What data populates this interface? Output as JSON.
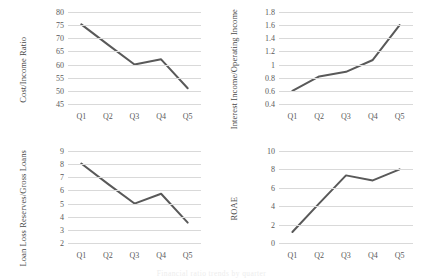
{
  "figure": {
    "caption": "Financial ratio trends by quarter"
  },
  "chart_data": [
    {
      "type": "line",
      "title": "",
      "ylabel": "Cost/Income Ratio",
      "xlabel": "",
      "categories": [
        "Q1",
        "Q2",
        "Q3",
        "Q4",
        "Q5"
      ],
      "values": [
        75.3,
        67.6,
        60.0,
        62.0,
        51.0
      ],
      "yticks": [
        45,
        50,
        55,
        60,
        65,
        70,
        75,
        80
      ],
      "yticklabels": [
        "45",
        "50",
        "55",
        "60",
        "65",
        "70",
        "75",
        "80"
      ],
      "ylim": [
        45,
        80
      ],
      "grid": true,
      "legend": "none",
      "line_color": "#595959"
    },
    {
      "type": "line",
      "title": "",
      "ylabel": "Interest Income/Operating Income",
      "xlabel": "",
      "categories": [
        "Q1",
        "Q2",
        "Q3",
        "Q4",
        "Q5"
      ],
      "values": [
        0.6,
        0.82,
        0.89,
        1.07,
        1.6
      ],
      "yticks": [
        0.4,
        0.6,
        0.8,
        1.0,
        1.2,
        1.4,
        1.6,
        1.8
      ],
      "yticklabels": [
        "0.4",
        "0.6",
        "0.8",
        "1",
        "1.2",
        "1.4",
        "1.6",
        "1.8"
      ],
      "ylim": [
        0.4,
        1.8
      ],
      "grid": true,
      "legend": "none",
      "line_color": "#595959"
    },
    {
      "type": "line",
      "title": "",
      "ylabel": "Loan Loss Reserves/Gross Loans",
      "xlabel": "",
      "categories": [
        "Q1",
        "Q2",
        "Q3",
        "Q4",
        "Q5"
      ],
      "values": [
        8.05,
        6.5,
        5.0,
        5.75,
        3.55
      ],
      "yticks": [
        2,
        3,
        4,
        5,
        6,
        7,
        8,
        9
      ],
      "yticklabels": [
        "2",
        "3",
        "4",
        "5",
        "6",
        "7",
        "8",
        "9"
      ],
      "ylim": [
        2,
        9
      ],
      "grid": true,
      "legend": "none",
      "line_color": "#595959"
    },
    {
      "type": "line",
      "title": "",
      "ylabel": "ROAE",
      "xlabel": "",
      "categories": [
        "Q1",
        "Q2",
        "Q3",
        "Q4",
        "Q5"
      ],
      "values": [
        1.2,
        4.3,
        7.35,
        6.8,
        8.0
      ],
      "yticks": [
        0,
        2,
        4,
        6,
        8,
        10
      ],
      "yticklabels": [
        "0",
        "2",
        "4",
        "6",
        "8",
        "10"
      ],
      "ylim": [
        0,
        10
      ],
      "grid": true,
      "legend": "none",
      "line_color": "#595959"
    }
  ]
}
